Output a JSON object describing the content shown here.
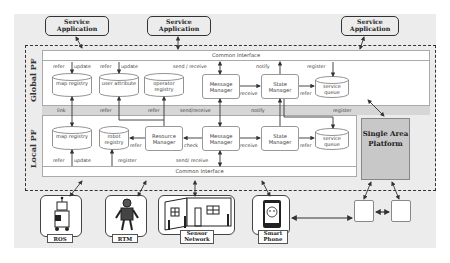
{
  "service_apps": [
    {
      "label": "Service Application"
    },
    {
      "label": "Service Application"
    },
    {
      "label": "Service Application"
    }
  ],
  "global_pf": {
    "label": "Global PF",
    "common_interface": "Common Interface",
    "components": {
      "map_registry": "map registry",
      "user_attribute": "user attribute",
      "operator_registry": "operator registry",
      "message_manager": "Message Manager",
      "state_manager": "State Manager",
      "service_queue": "service queue"
    },
    "labels": {
      "refer1": "refer",
      "update1": "update",
      "refer2": "refer",
      "update2": "update",
      "send_receive": "send / receive",
      "notify": "notify",
      "register": "register",
      "receive": "receive",
      "refer3": "refer"
    }
  },
  "band_labels": {
    "link": "link",
    "refer1": "refer",
    "refer2": "refer",
    "send_receive": "send/receive",
    "notify": "notify",
    "register": "register"
  },
  "local_pf": {
    "label": "Local PF",
    "common_interface": "Common Interface",
    "components": {
      "map_registry": "map registry",
      "robot_registry": "robot registry",
      "resource_manager": "Resource Manager",
      "message_manager": "Message Manager",
      "state_manager": "State Manager",
      "service_queue": "service queue"
    },
    "labels": {
      "refer_res": "refer",
      "check": "check",
      "receive": "receive",
      "refer_sq": "refer",
      "refer_bottom": "refer",
      "update_bottom": "update",
      "register_bottom": "register",
      "send_receive": "send/ receive"
    }
  },
  "single_area_platform": {
    "label": "Single Area Platform"
  },
  "devices": [
    {
      "label": "ROS",
      "icon": "robot-icon"
    },
    {
      "label": "RTM",
      "icon": "humanoid-robot-icon"
    },
    {
      "label": "Sensor Network",
      "icon": "room-sensor-icon"
    },
    {
      "label": "Smart Phone",
      "icon": "smartphone-icon"
    }
  ],
  "colors": {
    "background": "#ececec",
    "panel": "#ffffff",
    "band": "#d6d6d6",
    "sap": "#c8c8c8",
    "line": "#333333"
  }
}
